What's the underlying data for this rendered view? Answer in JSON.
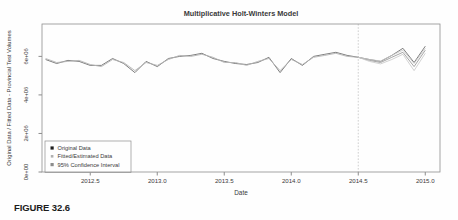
{
  "figure": {
    "caption": "FIGURE 32.6"
  },
  "colors": {
    "frame": "#8f8f8f",
    "tick": "#6f6f6f",
    "title_text": "#2b2b2b",
    "axis_text": "#3a3a3a",
    "divider_line": "#c9c9c9",
    "legend_border": "#8f8f8f"
  },
  "chart_data": {
    "type": "line",
    "title": "Multiplicative Holt-Winters Model",
    "xlabel": "Date",
    "ylabel": "Original Data / Fitted Data - Provincial Test Volumes",
    "grid": false,
    "legend_position": "bottom-left",
    "xlim": [
      2012.14,
      2015.11
    ],
    "ylim_millions": [
      0,
      7.68
    ],
    "xticks": [
      {
        "v": 2012.5,
        "label": "2012.5"
      },
      {
        "v": 2013.0,
        "label": "2013.0"
      },
      {
        "v": 2013.5,
        "label": "2013.5"
      },
      {
        "v": 2014.0,
        "label": "2014.0"
      },
      {
        "v": 2014.5,
        "label": "2014.5"
      },
      {
        "v": 2015.0,
        "label": "2015.0"
      }
    ],
    "yticks": [
      {
        "v": 0,
        "label": "0e+00"
      },
      {
        "v": 2,
        "label": "2e+06"
      },
      {
        "v": 4,
        "label": "4e+06"
      },
      {
        "v": 6,
        "label": "6e+06"
      }
    ],
    "forecast_start": 2014.5,
    "series": [
      {
        "name": "original-data",
        "legend_label": "Original Data",
        "color": "#6f6f6f",
        "width": 0.9,
        "t_start": 2012.1667,
        "dt": 0.0833333,
        "values_millions": [
          5.84,
          5.63,
          5.79,
          5.74,
          5.53,
          5.53,
          5.89,
          5.63,
          5.16,
          5.74,
          5.47,
          5.89,
          6.0,
          6.05,
          6.16,
          5.89,
          5.74,
          5.63,
          5.58,
          5.68,
          5.95,
          5.16,
          5.89,
          5.53,
          6.0,
          6.11,
          6.21,
          6.05,
          5.95,
          5.84,
          5.74,
          6.05,
          6.42,
          5.68,
          6.53
        ]
      },
      {
        "name": "fitted-estimated-data",
        "legend_label": "Fitted/Estimated Data",
        "color": "#b4b4b4",
        "width": 0.9,
        "t_start": 2012.1667,
        "dt": 0.0833333,
        "values_millions": [
          5.89,
          5.68,
          5.74,
          5.79,
          5.58,
          5.47,
          5.84,
          5.68,
          5.26,
          5.68,
          5.53,
          5.84,
          6.05,
          6.0,
          6.11,
          5.95,
          5.68,
          5.68,
          5.53,
          5.74,
          5.89,
          5.26,
          5.84,
          5.58,
          5.95,
          6.05,
          6.16,
          6.0,
          5.95
        ]
      },
      {
        "name": "forecast",
        "legend_label": null,
        "color": "#9c9c9c",
        "width": 0.9,
        "t_start": 2014.5,
        "dt": 0.0833333,
        "values_millions": [
          5.95,
          5.79,
          5.68,
          5.95,
          6.21,
          5.47,
          6.32
        ]
      },
      {
        "name": "ci-upper",
        "legend_label": null,
        "color": "#c6c6c6",
        "width": 0.8,
        "t_start": 2014.5,
        "dt": 0.0833333,
        "values_millions": [
          5.95,
          5.84,
          5.76,
          6.05,
          6.32,
          5.63,
          6.42
        ]
      },
      {
        "name": "ci-lower",
        "legend_label": null,
        "color": "#c6c6c6",
        "width": 0.8,
        "t_start": 2014.5,
        "dt": 0.0833333,
        "values_millions": [
          5.95,
          5.74,
          5.61,
          5.84,
          6.11,
          5.26,
          6.16
        ]
      }
    ],
    "legend": [
      {
        "label": "Original Data",
        "marker_color": "#1f1f1f",
        "marker_size": 3.2
      },
      {
        "label": "Fitted/Estimated Data",
        "marker_color": "#b0b0b0",
        "marker_size": 2.6
      },
      {
        "label": "95% Confidence Interval",
        "marker_color": "#8c8c8c",
        "marker_size": 3.2
      }
    ]
  }
}
